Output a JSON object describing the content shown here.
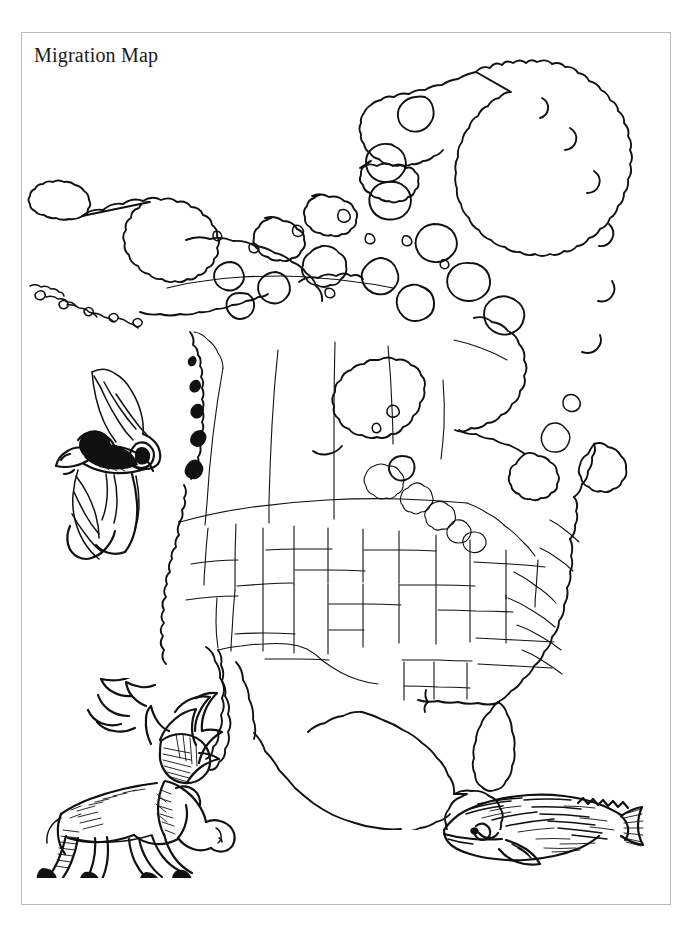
{
  "document": {
    "title": "Migration Map",
    "page_width": 690,
    "page_height": 925,
    "background_color": "#ffffff",
    "ink_color": "#111111",
    "border_color": "#b9b9b9",
    "style": "black and white line-art worksheet",
    "footer_watermark": ""
  },
  "map": {
    "name": "north-america-outline-map",
    "region": "North America",
    "projection_note": "outline map with national, state and provincial boundaries",
    "features": [
      "Alaska",
      "Aleutian Islands",
      "Canada",
      "Canadian Arctic Archipelago",
      "Greenland",
      "Hudson Bay",
      "Great Lakes",
      "United States",
      "Baja California",
      "Mexico",
      "Yucatan Peninsula",
      "Florida Peninsula",
      "Newfoundland"
    ],
    "fill": "none",
    "stroke": "#111111"
  },
  "illustrations": [
    {
      "name": "bat-illustration",
      "label": "Bat",
      "description": "hand-drawn bat with outspread wings",
      "position": "left middle"
    },
    {
      "name": "caribou-illustration",
      "label": "Caribou",
      "description": "hand-drawn caribou with large branching antlers",
      "position": "lower left"
    },
    {
      "name": "whale-illustration",
      "label": "Gray Whale",
      "description": "hand-drawn gray whale with ridged back and tail flukes",
      "position": "lower right"
    }
  ]
}
